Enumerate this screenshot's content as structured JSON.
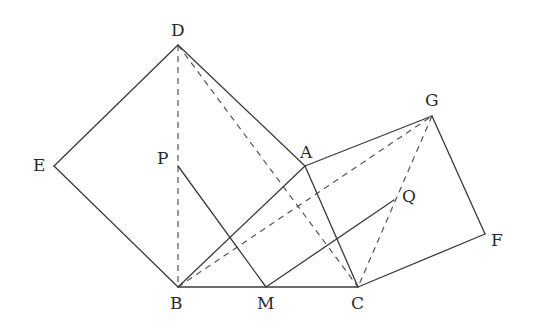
{
  "diagram": {
    "type": "geometry",
    "points": {
      "A": {
        "x": 305,
        "y": 166,
        "label": "A",
        "lx": 300,
        "ly": 158
      },
      "B": {
        "x": 178,
        "y": 287,
        "label": "B",
        "lx": 170,
        "ly": 309
      },
      "C": {
        "x": 358,
        "y": 287,
        "label": "C",
        "lx": 351,
        "ly": 309
      },
      "D": {
        "x": 178,
        "y": 45,
        "label": "D",
        "lx": 171,
        "ly": 36
      },
      "E": {
        "x": 54,
        "y": 166,
        "label": "E",
        "lx": 33,
        "ly": 171
      },
      "F": {
        "x": 485,
        "y": 234,
        "label": "F",
        "lx": 491,
        "ly": 246
      },
      "G": {
        "x": 432,
        "y": 116,
        "label": "G",
        "lx": 425,
        "ly": 106
      },
      "M": {
        "x": 266,
        "y": 287,
        "label": "M",
        "lx": 257,
        "ly": 309
      },
      "P": {
        "x": 178,
        "y": 166,
        "label": "P",
        "lx": 157,
        "ly": 164
      },
      "Q": {
        "x": 394,
        "y": 200,
        "label": "Q",
        "lx": 402,
        "ly": 202
      }
    },
    "solid_segments": [
      [
        "D",
        "E"
      ],
      [
        "E",
        "B"
      ],
      [
        "D",
        "A"
      ],
      [
        "A",
        "B"
      ],
      [
        "A",
        "G"
      ],
      [
        "G",
        "F"
      ],
      [
        "F",
        "C"
      ],
      [
        "A",
        "C"
      ],
      [
        "B",
        "C"
      ],
      [
        "P",
        "M"
      ],
      [
        "M",
        "Q"
      ]
    ],
    "dashed_segments": [
      [
        "D",
        "B"
      ],
      [
        "D",
        "C"
      ],
      [
        "B",
        "G"
      ],
      [
        "G",
        "C"
      ]
    ],
    "colors": {
      "line": "#3a3a3a",
      "dashed": "#555555",
      "label": "#2a2a2a"
    }
  }
}
